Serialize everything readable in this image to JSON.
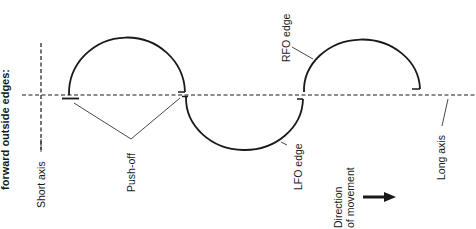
{
  "title": "forward outside edges:",
  "labels": {
    "short_axis": "Short axis",
    "long_axis": "Long axis",
    "push_off": "Push-off",
    "rfo_edge": "RFO edge",
    "lfo_edge": "LFO edge",
    "direction_line1": "Direction",
    "direction_line2": "of movement"
  },
  "colors": {
    "line": "#1a1a1a",
    "background": "#ffffff"
  },
  "geometry": {
    "long_axis_y": 95,
    "short_axis_x": 41,
    "arcs": [
      {
        "name": "rfo-arc-1",
        "from_x": 69,
        "to_x": 185,
        "side": "above"
      },
      {
        "name": "lfo-arc",
        "from_x": 186,
        "to_x": 303,
        "side": "below"
      },
      {
        "name": "rfo-arc-2",
        "from_x": 304,
        "to_x": 420,
        "side": "above"
      }
    ]
  }
}
